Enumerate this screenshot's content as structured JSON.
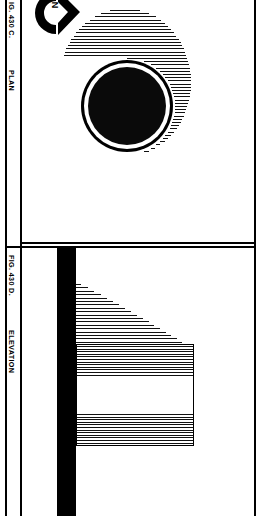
{
  "figure": {
    "sheet_title": "FIG. 430 C. / FIG. 430 D.",
    "plan": {
      "figure_number": "IG. 430 C.",
      "view_label": "PLAN",
      "north_arrow": {
        "icon": "north-arrow-icon",
        "letter": "N"
      },
      "elements": {
        "disc": "filled-circle",
        "shadow": "hatched-ellipse-shadow"
      }
    },
    "elevation": {
      "figure_number": "FIG. 430 D.",
      "view_label": "ELEVATION",
      "elements": {
        "wall": "vertical-black-wall",
        "wedge": "hatched-triangular-wedge",
        "box": "hatched-rectangle"
      }
    }
  },
  "colors": {
    "ink": "#000000",
    "paper": "#ffffff",
    "hatch": "#111111"
  }
}
